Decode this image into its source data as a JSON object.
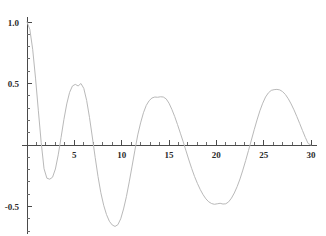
{
  "chart_data": {
    "type": "line",
    "title": "",
    "subtitle": "",
    "xlabel": "",
    "ylabel": "",
    "xlim": [
      0,
      30.6
    ],
    "ylim": [
      -0.72,
      1.04
    ],
    "grid": false,
    "legend": null,
    "legend_position": "none",
    "x_ticks_major": [
      5,
      10,
      15,
      20,
      25,
      30
    ],
    "x_tick_labels": [
      "5",
      "10",
      "15",
      "20",
      "25",
      "30"
    ],
    "x_tick_minor_step": 1,
    "y_ticks_major": [
      1.0,
      0.5,
      -0.5
    ],
    "y_tick_labels": [
      "1.0",
      "0.5",
      "-0.5"
    ],
    "y_tick_minor_step": 0.1,
    "axis_origin": [
      0,
      0
    ],
    "series": [
      {
        "name": "damped oscillation",
        "color": "#b9b9b9",
        "x": [
          0.0,
          0.3,
          0.6,
          0.9,
          1.2,
          1.5,
          1.8,
          2.1,
          2.4,
          2.7,
          3.0,
          3.3,
          3.6,
          3.9,
          4.2,
          4.5,
          4.8,
          5.1,
          5.4,
          5.7,
          6.0,
          6.3,
          6.6,
          6.9,
          7.2,
          7.5,
          7.8,
          8.1,
          8.4,
          8.7,
          9.0,
          9.3,
          9.6,
          9.9,
          10.2,
          10.5,
          10.8,
          11.1,
          11.4,
          11.7,
          12.0,
          12.3,
          12.6,
          12.9,
          13.2,
          13.5,
          13.8,
          14.1,
          14.4,
          14.7,
          15.0,
          15.3,
          15.6,
          15.9,
          16.2,
          16.5,
          16.8,
          17.1,
          17.4,
          17.7,
          18.0,
          18.3,
          18.6,
          18.9,
          19.2,
          19.5,
          19.8,
          20.1,
          20.4,
          20.7,
          21.0,
          21.3,
          21.6,
          21.9,
          22.2,
          22.5,
          22.8,
          23.1,
          23.4,
          23.7,
          24.0,
          24.3,
          24.6,
          24.9,
          25.2,
          25.5,
          25.8,
          26.1,
          26.4,
          26.7,
          27.0,
          27.3,
          27.6,
          27.9,
          28.2,
          28.5,
          28.8,
          29.1,
          29.4,
          29.7,
          30.0
        ],
        "y": [
          1.0,
          0.94,
          0.778,
          0.544,
          0.278,
          0.02,
          -0.193,
          -0.27,
          -0.278,
          -0.262,
          -0.195,
          -0.08,
          0.062,
          0.208,
          0.334,
          0.428,
          0.48,
          0.493,
          0.48,
          0.5,
          0.46,
          0.363,
          0.225,
          0.065,
          -0.1,
          -0.256,
          -0.388,
          -0.49,
          -0.566,
          -0.62,
          -0.65,
          -0.662,
          -0.648,
          -0.6,
          -0.52,
          -0.42,
          -0.3,
          -0.172,
          -0.042,
          0.082,
          0.18,
          0.262,
          0.322,
          0.36,
          0.382,
          0.39,
          0.388,
          0.392,
          0.39,
          0.375,
          0.34,
          0.29,
          0.232,
          0.166,
          0.096,
          0.026,
          -0.048,
          -0.122,
          -0.192,
          -0.256,
          -0.312,
          -0.362,
          -0.404,
          -0.438,
          -0.462,
          -0.476,
          -0.482,
          -0.478,
          -0.474,
          -0.48,
          -0.478,
          -0.462,
          -0.432,
          -0.39,
          -0.338,
          -0.276,
          -0.204,
          -0.126,
          -0.044,
          0.04,
          0.124,
          0.204,
          0.278,
          0.34,
          0.39,
          0.424,
          0.444,
          0.45,
          0.452,
          0.448,
          0.434,
          0.41,
          0.376,
          0.334,
          0.286,
          0.232,
          0.176,
          0.118,
          0.062,
          0.012,
          0.0
        ]
      }
    ],
    "annotations": []
  },
  "plot": {
    "background_color": "#ffffff",
    "axis_color": "#4a4a4a",
    "curve_color": "#b9b9b9"
  }
}
